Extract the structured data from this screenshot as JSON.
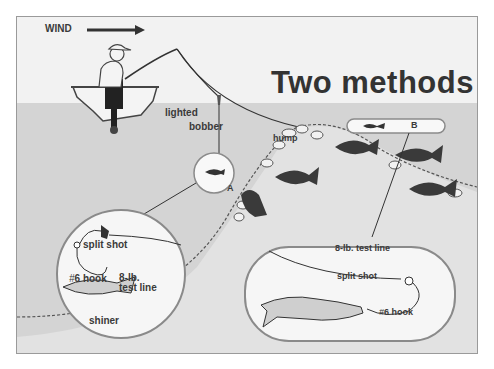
{
  "diagram": {
    "title": "Two methods",
    "wind_label": "WIND",
    "labels": {
      "lighted_bobber_1": "lighted",
      "lighted_bobber_2": "bobber",
      "hump": "hump",
      "method_a": "A",
      "method_b": "B"
    },
    "inset_a": {
      "split_shot": "split shot",
      "hook": "6 hook",
      "hook_prefix": "#",
      "line_1": "8-lb.",
      "line_2": "test line",
      "bait": "shiner"
    },
    "inset_b": {
      "line": "8-lb. test line",
      "split_shot": "split shot",
      "hook": "6 hook",
      "hook_prefix": "#"
    },
    "colors": {
      "sky": "#f2f2f2",
      "water": "#d6d6d6",
      "ink": "#333333",
      "fish": "#3a3a3a",
      "inset_fill": "#fafafa",
      "inset_border": "#8a8a8a"
    }
  }
}
